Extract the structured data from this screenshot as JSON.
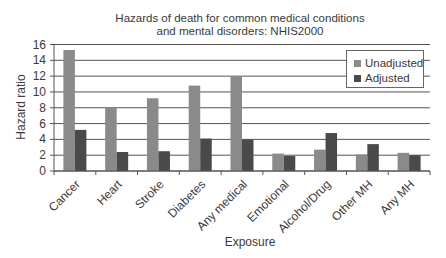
{
  "chart_data": {
    "type": "bar",
    "title": "Hazards of death for common medical conditions and mental disorders: NHIS2000",
    "title_lines": [
      "Hazards of death for common medical conditions",
      "and mental disorders: NHIS2000"
    ],
    "xlabel": "Exposure",
    "ylabel": "Hazard ratio",
    "ylim": [
      0,
      16
    ],
    "yticks": [
      0,
      2,
      4,
      6,
      8,
      10,
      12,
      14,
      16
    ],
    "grid": true,
    "legend_position": "upper right",
    "categories": [
      "Cancer",
      "Heart",
      "Stroke",
      "Diabetes",
      "Any medical",
      "Emotional",
      "Alcohol/Drug",
      "Other MH",
      "Any MH"
    ],
    "series": [
      {
        "name": "Unadjusted",
        "color": "#8a8a8a",
        "values": [
          15.3,
          8.0,
          9.2,
          10.8,
          12.0,
          2.2,
          2.7,
          2.1,
          2.3
        ]
      },
      {
        "name": "Adjusted",
        "color": "#4a4a4a",
        "values": [
          5.2,
          2.4,
          2.5,
          4.1,
          4.0,
          1.9,
          4.8,
          3.4,
          2.0
        ]
      }
    ]
  }
}
